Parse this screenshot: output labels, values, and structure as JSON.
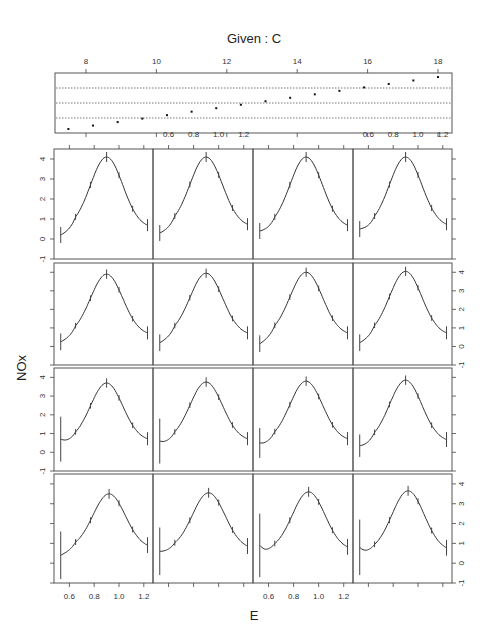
{
  "chart_data": {
    "type": "line",
    "title": "Given : C",
    "xlabel": "E",
    "ylabel": "NOx",
    "given": {
      "label": "Given : C",
      "xlim": [
        7.3,
        18.4
      ],
      "ticks": [
        8,
        10,
        12,
        14,
        16,
        18
      ],
      "tick_labels": [
        "8",
        "10",
        "12",
        "14",
        "16",
        "18"
      ],
      "points": [
        7.5,
        8.2,
        8.9,
        9.6,
        10.3,
        11.0,
        11.7,
        12.4,
        13.1,
        13.8,
        14.5,
        15.2,
        15.9,
        16.6,
        17.3,
        18.0
      ],
      "dotted_levels": 3
    },
    "panel_xlim": [
      0.5,
      1.25
    ],
    "panel_ylim": [
      -1,
      4.5
    ],
    "x_ticks": [
      0.6,
      0.8,
      1.0,
      1.2
    ],
    "x_tick_labels": [
      "0.6",
      "0.8",
      "1.0",
      "1.2"
    ],
    "y_ticks": [
      -1,
      0,
      1,
      2,
      3,
      4
    ],
    "y_tick_labels": [
      "-1",
      "0",
      "1",
      "2",
      "3",
      "4"
    ],
    "rows": 4,
    "cols": 4,
    "panels": [
      {
        "peak": 4.1,
        "peak_x": 0.9,
        "left": 0.2,
        "right": 0.55,
        "lbar": 0.4,
        "rbar": 0.3,
        "dip": 0
      },
      {
        "peak": 4.1,
        "peak_x": 0.9,
        "left": 0.3,
        "right": 0.6,
        "lbar": 0.4,
        "rbar": 0.3,
        "dip": 0
      },
      {
        "peak": 4.1,
        "peak_x": 0.9,
        "left": 0.4,
        "right": 0.55,
        "lbar": 0.4,
        "rbar": 0.3,
        "dip": 0
      },
      {
        "peak": 4.1,
        "peak_x": 0.9,
        "left": 0.5,
        "right": 0.6,
        "lbar": 0.4,
        "rbar": 0.3,
        "dip": 0
      },
      {
        "peak": 3.9,
        "peak_x": 0.9,
        "left": 0.25,
        "right": 0.6,
        "lbar": 0.45,
        "rbar": 0.35,
        "dip": 0
      },
      {
        "peak": 3.95,
        "peak_x": 0.9,
        "left": 0.2,
        "right": 0.6,
        "lbar": 0.45,
        "rbar": 0.35,
        "dip": 0
      },
      {
        "peak": 4.0,
        "peak_x": 0.9,
        "left": 0.15,
        "right": 0.6,
        "lbar": 0.45,
        "rbar": 0.35,
        "dip": 0
      },
      {
        "peak": 4.05,
        "peak_x": 0.9,
        "left": 0.2,
        "right": 0.6,
        "lbar": 0.45,
        "rbar": 0.35,
        "dip": 0
      },
      {
        "peak": 3.7,
        "peak_x": 0.9,
        "left": 0.7,
        "right": 0.6,
        "lbar": 1.2,
        "rbar": 0.35,
        "dip": 0.6
      },
      {
        "peak": 3.75,
        "peak_x": 0.9,
        "left": 0.6,
        "right": 0.6,
        "lbar": 1.2,
        "rbar": 0.35,
        "dip": 0.5
      },
      {
        "peak": 3.8,
        "peak_x": 0.9,
        "left": 0.5,
        "right": 0.6,
        "lbar": 0.8,
        "rbar": 0.35,
        "dip": 0.4
      },
      {
        "peak": 3.85,
        "peak_x": 0.9,
        "left": 0.35,
        "right": 0.55,
        "lbar": 0.6,
        "rbar": 0.4,
        "dip": 0.3
      },
      {
        "peak": 3.5,
        "peak_x": 0.92,
        "left": 0.4,
        "right": 0.75,
        "lbar": 1.2,
        "rbar": 0.4,
        "dip": 0.4
      },
      {
        "peak": 3.55,
        "peak_x": 0.92,
        "left": 0.6,
        "right": 0.7,
        "lbar": 1.2,
        "rbar": 0.4,
        "dip": 0.55
      },
      {
        "peak": 3.6,
        "peak_x": 0.92,
        "left": 0.9,
        "right": 0.65,
        "lbar": 1.6,
        "rbar": 0.4,
        "dip": 0.65
      },
      {
        "peak": 3.65,
        "peak_x": 0.92,
        "left": 0.8,
        "right": 0.6,
        "lbar": 1.4,
        "rbar": 0.4,
        "dip": 0.6
      }
    ]
  }
}
